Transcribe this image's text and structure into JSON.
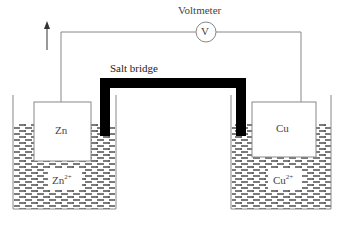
{
  "diagram": {
    "type": "galvanic-cell",
    "labels": {
      "voltmeter": "Voltmeter",
      "voltmeter_symbol": "V",
      "salt_bridge": "Salt bridge",
      "anode": "Zn",
      "anode_ion_base": "Zn",
      "anode_ion_charge": "2+",
      "cathode": "Cu",
      "cathode_ion_base": "Cu",
      "cathode_ion_charge": "2+"
    },
    "colors": {
      "line": "#888888",
      "salt_bridge": "#000000",
      "solution_dash": "#333333",
      "text": "#444444"
    }
  }
}
